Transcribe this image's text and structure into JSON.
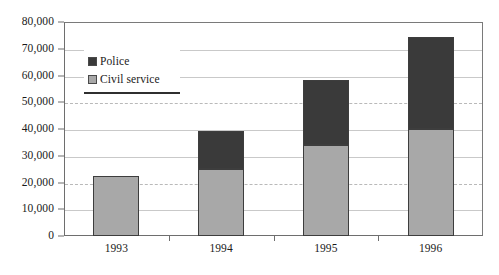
{
  "chart_data": {
    "type": "bar",
    "subtype": "stacked-column",
    "title": "",
    "xlabel": "",
    "ylabel": "",
    "categories": [
      "1993",
      "1994",
      "1995",
      "1996"
    ],
    "series": [
      {
        "name": "Civil service",
        "color": "#a8a8a8",
        "values": [
          22500,
          25000,
          34000,
          40000
        ]
      },
      {
        "name": "Police",
        "color": "#3a3a3a",
        "values": [
          0,
          14300,
          24300,
          34400
        ]
      }
    ],
    "stack_order": [
      "Civil service",
      "Police"
    ],
    "totals": [
      22500,
      39300,
      58300,
      74400
    ],
    "ylim": [
      0,
      80000
    ],
    "yticks": [
      0,
      10000,
      20000,
      30000,
      40000,
      50000,
      60000,
      70000,
      80000
    ],
    "ytick_labels": [
      "0",
      "10,000",
      "20,000",
      "30,000",
      "40,000",
      "50,000",
      "60,000",
      "70,000",
      "80,000"
    ],
    "grid": true,
    "grid_axis": "y",
    "legend_position": "inside-upper-left",
    "legend_entries": [
      {
        "label": "Police",
        "color": "#3a3a3a"
      },
      {
        "label": "Civil service",
        "color": "#a8a8a8"
      }
    ]
  },
  "axes": {
    "frame_color": "#6e6e6e",
    "gridline_color": "#c9c9c9",
    "bar_border_color": "#3d3d3d"
  }
}
